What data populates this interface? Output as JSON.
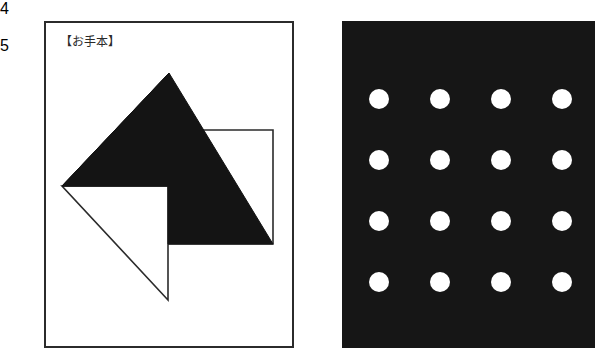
{
  "page": {
    "background_color": "#ffffff",
    "width": 602,
    "height": 357
  },
  "panels": [
    {
      "number": "4",
      "caption": "【お手本】",
      "kind": "line-figure",
      "frame_color": "#2b2b2b",
      "fill_color": "#ffffff",
      "shape_color": "#141414"
    },
    {
      "number": "5",
      "caption": "",
      "kind": "dot-grid",
      "background_color": "#161616",
      "dot_color": "#ffffff"
    }
  ],
  "panel4": {
    "badge_label": "4",
    "caption": "【お手本】",
    "figure_name": "pinwheel-arrow-diagram",
    "shape_color": "#141414",
    "outline_color": "#2b2b2b"
  },
  "panel5": {
    "badge_label": "5",
    "figure_name": "dot-grid-4x4",
    "background_color": "#161616",
    "dot_color": "#ffffff",
    "grid_rows": 4,
    "grid_cols": 4,
    "dot_count": 16,
    "dot_radius": 10
  },
  "chart_data": {
    "type": "scatter",
    "title": "",
    "xlabel": "",
    "ylabel": "",
    "rows": 4,
    "cols": 4,
    "dot_radius": 10,
    "col_x": [
      37,
      98,
      159,
      220
    ],
    "row_y": [
      78,
      139,
      200,
      261
    ],
    "grid": false,
    "legend": "none"
  }
}
